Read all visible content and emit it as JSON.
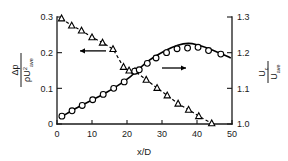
{
  "chart_data": {
    "type": "line",
    "title": "",
    "xlabel": "x/D",
    "ylabel_left_numerator": "Δp",
    "ylabel_left_denominator": "ρU²ave",
    "ylabel_right_numerator": "Uc",
    "ylabel_right_denominator": "Uave",
    "xlim": [
      0,
      50
    ],
    "xticks": [
      0,
      10,
      20,
      30,
      40,
      50
    ],
    "xtick_labels": [
      "0",
      "10",
      "20",
      "30",
      "40",
      "50"
    ],
    "ylim_left": [
      0,
      0.3
    ],
    "yticks_left": [
      0,
      0.1,
      0.2,
      0.3
    ],
    "ytick_labels_left": [
      "0",
      "0.1",
      "0.2",
      "0.3"
    ],
    "ylim_right": [
      1.0,
      1.3
    ],
    "yticks_right": [
      1.0,
      1.1,
      1.2,
      1.3
    ],
    "ytick_labels_right": [
      "1.0",
      "1.1",
      "1.2",
      "1.3"
    ],
    "grid": false,
    "legend": "none",
    "annotations": [
      {
        "name": "left-axis-arrow",
        "text": "←",
        "x": 14,
        "y_left": 0.205
      },
      {
        "name": "right-axis-arrow",
        "text": "→",
        "x": 30,
        "y_right": 1.157
      }
    ],
    "series": [
      {
        "name": "pressure-drop",
        "marker": "triangle",
        "linestyle": "dashed",
        "axis": "left",
        "x": [
          1.3,
          4.2,
          7.0,
          10.0,
          13.0,
          16.0,
          19.0,
          20.6,
          22.3,
          25.5,
          28.6,
          31.5,
          34.6,
          37.6,
          40.5,
          44.2
        ],
        "y": [
          0.296,
          0.276,
          0.262,
          0.243,
          0.228,
          0.21,
          0.16,
          0.15,
          0.148,
          0.124,
          0.101,
          0.08,
          0.057,
          0.04,
          0.022,
          0.002
        ]
      },
      {
        "name": "centerline-velocity",
        "marker": "circle",
        "linestyle": "solid",
        "axis": "right",
        "x": [
          1.4,
          4.3,
          7.2,
          10.2,
          13.2,
          16.2,
          19.2,
          22.2,
          23.5,
          25.8,
          28.3,
          31.3,
          34.3,
          37.3,
          40.3,
          43.3,
          46.8
        ],
        "y": [
          1.022,
          1.037,
          1.052,
          1.068,
          1.083,
          1.1,
          1.118,
          1.148,
          1.152,
          1.17,
          1.185,
          1.2,
          1.211,
          1.213,
          1.215,
          1.206,
          1.196
        ]
      }
    ],
    "fit_curve": {
      "name": "velocity-fit-line",
      "axis": "right",
      "x": [
        1.4,
        6.0,
        11.0,
        16.0,
        21.0,
        26.0,
        31.0,
        34.5,
        37.5,
        40.0,
        44.0,
        49.5
      ],
      "y": [
        1.021,
        1.047,
        1.072,
        1.099,
        1.133,
        1.176,
        1.206,
        1.221,
        1.226,
        1.222,
        1.209,
        1.186
      ]
    }
  },
  "colors": {
    "axis": "#1a1a1a",
    "series_primary": "#000000",
    "background": "#ffffff"
  }
}
